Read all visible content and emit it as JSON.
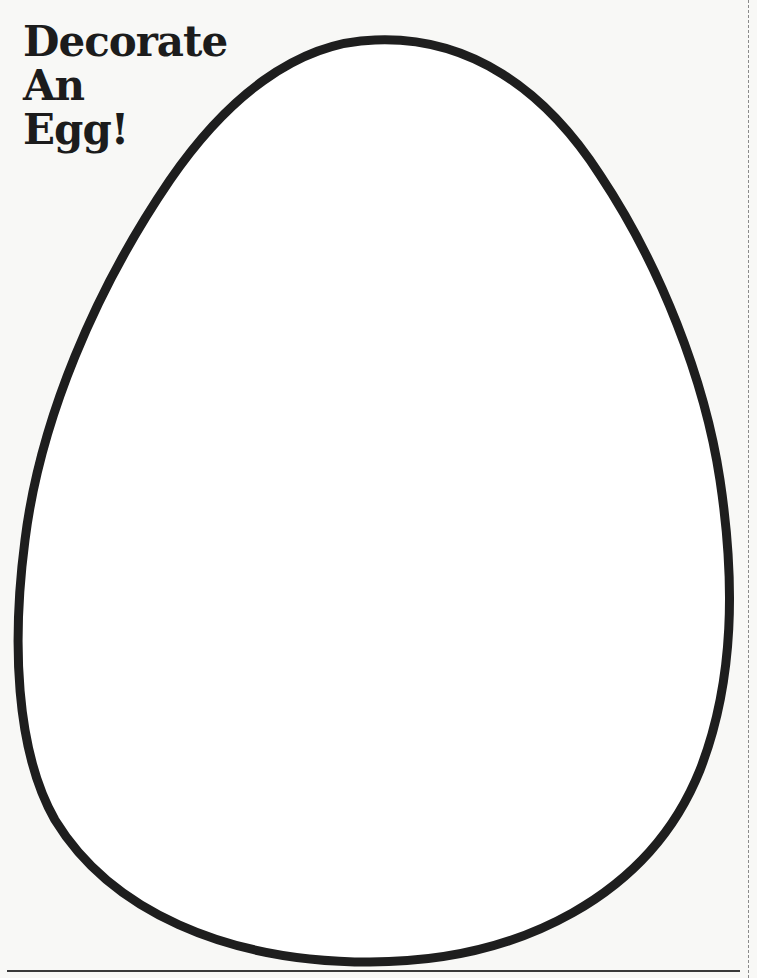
{
  "page": {
    "title_lines": [
      "Decorate",
      "An",
      "Egg!"
    ],
    "colors": {
      "background": "#f8f8f6",
      "outline": "#1e1e1e",
      "title": "#1c1c1c"
    }
  },
  "canvas": {
    "shape": "egg-outline",
    "fill": "blank"
  }
}
